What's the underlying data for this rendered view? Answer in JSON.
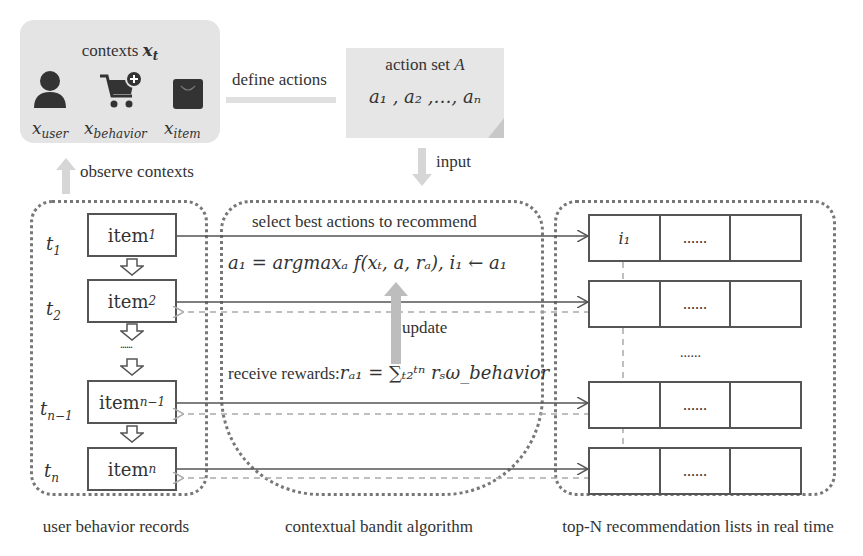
{
  "contexts": {
    "title": "contexts x_t",
    "title_text": "contexts ",
    "title_var": "x",
    "title_sub": "t",
    "icons": [
      {
        "name": "user-icon",
        "label": "x",
        "sub": "user"
      },
      {
        "name": "shopping-cart-add-icon",
        "label": "x",
        "sub": "behavior"
      },
      {
        "name": "shopping-bag-icon",
        "label": "x",
        "sub": "item"
      }
    ]
  },
  "action_set": {
    "title": "action set A",
    "values": "a₁ , a₂ ,…, aₙ"
  },
  "arrows": {
    "define_actions": "define actions",
    "observe_contexts": "observe contexts",
    "input": "input",
    "update": "update"
  },
  "user_behavior": {
    "caption": "user behavior records",
    "times": [
      {
        "t": "t",
        "sub": "1"
      },
      {
        "t": "t",
        "sub": "2"
      },
      {
        "t": "t",
        "sub": "n−1"
      },
      {
        "t": "t",
        "sub": "n"
      }
    ],
    "items": [
      {
        "label": "item",
        "sub": "1"
      },
      {
        "label": "item",
        "sub": "2"
      },
      {
        "label": "item",
        "sub": "n−1"
      },
      {
        "label": "item",
        "sub": "n"
      }
    ],
    "ellipsis": "......"
  },
  "bandit": {
    "caption": "contextual bandit algorithm",
    "select_label": "select best actions to recommend",
    "formula": "a₁ = argmaxₐ f(xₜ, a, rₐ),  i₁ ← a₁",
    "reward_label": "receive rewards:",
    "reward_formula": "rₐ₁ = ∑ₜ₂ᵗⁿ rₛω_behavior"
  },
  "recommendation": {
    "caption": "top-N  recommendation lists in real time",
    "rows": [
      {
        "cells": [
          "i₁",
          "......",
          ""
        ]
      },
      {
        "cells": [
          "",
          "......",
          ""
        ]
      },
      {
        "cells": [
          "",
          "......",
          ""
        ]
      },
      {
        "cells": [
          "",
          "......",
          ""
        ]
      }
    ],
    "ellipsis": "......"
  }
}
